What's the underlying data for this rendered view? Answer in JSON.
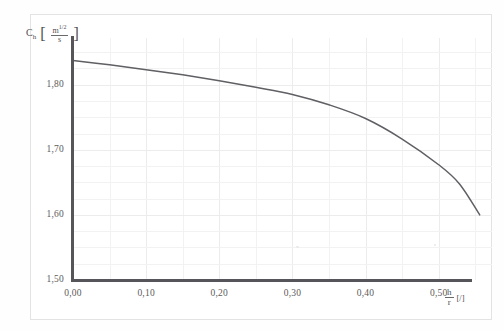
{
  "chart_data": {
    "type": "line",
    "title": "",
    "xlabel": "h/r [/]",
    "ylabel": "C_h [m^1/2 / s]",
    "xlim": [
      0.0,
      0.5729
    ],
    "ylim": [
      1.5,
      1.8716
    ],
    "grid": true,
    "legend": null,
    "x_tick_labels": [
      "0,00",
      "0,10",
      "0,20",
      "0,30",
      "0,40",
      "0,50"
    ],
    "x_tick_values": [
      0.0,
      0.1,
      0.2,
      0.3,
      0.4,
      0.5
    ],
    "y_tick_labels": [
      "1,50",
      "1,60",
      "1,70",
      "1,80"
    ],
    "y_tick_values": [
      1.5,
      1.6,
      1.7,
      1.8
    ],
    "decimal_separator": ",",
    "series": [
      {
        "name": "Ch",
        "color": "#5f5f64",
        "x": [
          0.0,
          0.05,
          0.1,
          0.15,
          0.2,
          0.25,
          0.3,
          0.35,
          0.4,
          0.45,
          0.5,
          0.5285,
          0.5561
        ],
        "values": [
          1.837,
          1.8305,
          1.823,
          1.815,
          1.806,
          1.796,
          1.785,
          1.769,
          1.748,
          1.7165,
          1.677,
          1.6475,
          1.6
        ]
      }
    ]
  },
  "axis_titles": {
    "y_symbol": "C",
    "y_subscript": "h",
    "y_unit_numerator": "m",
    "y_unit_numerator_exponent": "1/2",
    "y_unit_denominator": "s",
    "x_numerator": "h",
    "x_denominator": "r",
    "x_unit": "[/]"
  }
}
